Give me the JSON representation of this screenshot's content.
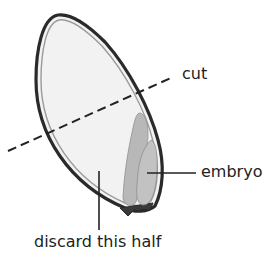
{
  "diagram": {
    "labels": {
      "cut": "cut",
      "embryo": "embryo",
      "discard": "discard this half"
    },
    "colors": {
      "seed_outline": "#2a2a2a",
      "seed_inner_ring": "#9a9a9a",
      "endosperm_fill": "#f2f2f2",
      "embryo_fill": "#b5b5b5",
      "embryo_dark": "#8f8f8f",
      "leader_line": "#222222",
      "text": "#222222"
    }
  }
}
